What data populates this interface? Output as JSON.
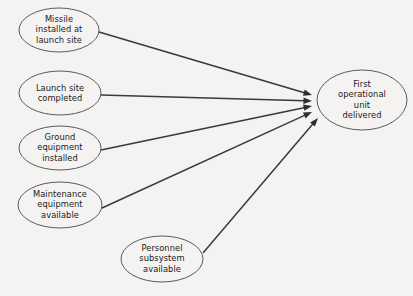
{
  "diagram": {
    "type": "network-dependency-diagram",
    "title": "",
    "background_color": "#f4f3f1",
    "node_fill_color": "#f4f3f1",
    "node_stroke_color": "#4a4a4a",
    "edge_color": "#3a3a3a",
    "text_color": "#1a1a1a",
    "nodes": [
      {
        "id": "missile-installed",
        "label": "Missile\ninstalled at\nlaunch site",
        "cx": 59,
        "cy": 30,
        "rx": 40,
        "ry": 22
      },
      {
        "id": "launch-site-completed",
        "label": "Launch site\ncompleted",
        "cx": 60,
        "cy": 93,
        "rx": 41,
        "ry": 22
      },
      {
        "id": "ground-equipment-installed",
        "label": "Ground\nequipment\ninstalled",
        "cx": 60,
        "cy": 148,
        "rx": 41,
        "ry": 22
      },
      {
        "id": "maintenance-equipment-available",
        "label": "Maintenance\nequipment\navailable",
        "cx": 60,
        "cy": 205,
        "rx": 42,
        "ry": 23
      },
      {
        "id": "personnel-subsystem-available",
        "label": "Personnel\nsubsystem\navailable",
        "cx": 162,
        "cy": 259,
        "rx": 41,
        "ry": 23
      },
      {
        "id": "first-operational-unit-delivered",
        "label": "First\noperational\nunit delivered",
        "cx": 362,
        "cy": 100,
        "rx": 45,
        "ry": 30
      }
    ],
    "edges": [
      {
        "id": "edge-missile-to-unit",
        "from": "missile-installed",
        "to": "first-operational-unit-delivered",
        "x1": 99,
        "y1": 32,
        "x2": 312,
        "y2": 95
      },
      {
        "id": "edge-launch-site-to-unit",
        "from": "launch-site-completed",
        "to": "first-operational-unit-delivered",
        "x1": 101,
        "y1": 95,
        "x2": 312,
        "y2": 101
      },
      {
        "id": "edge-ground-equipment-to-unit",
        "from": "ground-equipment-installed",
        "to": "first-operational-unit-delivered",
        "x1": 101,
        "y1": 150,
        "x2": 312,
        "y2": 106
      },
      {
        "id": "edge-maintenance-to-unit",
        "from": "maintenance-equipment-available",
        "to": "first-operational-unit-delivered",
        "x1": 102,
        "y1": 208,
        "x2": 312,
        "y2": 112
      },
      {
        "id": "edge-personnel-to-unit",
        "from": "personnel-subsystem-available",
        "to": "first-operational-unit-delivered",
        "x1": 203,
        "y1": 253,
        "x2": 318,
        "y2": 118
      }
    ]
  }
}
